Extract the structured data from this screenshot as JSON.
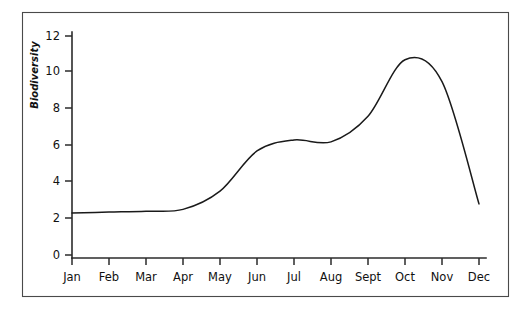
{
  "chart_data": {
    "type": "line",
    "title": "",
    "subtitle": "",
    "xlabel": "",
    "ylabel": "Biodiversity",
    "categories": [
      "Jan",
      "Feb",
      "Mar",
      "Apr",
      "May",
      "Jun",
      "Jul",
      "Aug",
      "Sept",
      "Oct",
      "Nov",
      "Dec"
    ],
    "values": [
      2.3,
      2.35,
      2.4,
      2.5,
      3.5,
      5.7,
      6.3,
      6.2,
      7.6,
      10.7,
      9.5,
      2.8
    ],
    "series": [
      {
        "name": "Biodiversity",
        "values": [
          2.3,
          2.35,
          2.4,
          2.5,
          3.5,
          5.7,
          6.3,
          6.2,
          7.6,
          10.7,
          9.5,
          2.8
        ]
      }
    ],
    "ylim": [
      0,
      12
    ],
    "yticks": [
      0,
      2,
      4,
      6,
      8,
      10,
      12
    ],
    "ytick_labels": [
      "0",
      "2",
      "4",
      "6",
      "8",
      "10",
      "12"
    ],
    "xtick_labels": [
      "Jan",
      "Feb",
      "Mar",
      "Apr",
      "May",
      "Jun",
      "Jul",
      "Aug",
      "Sept",
      "Oct",
      "Nov",
      "Dec"
    ],
    "grid": false,
    "legend": "none",
    "annotations": [],
    "peak": {
      "label": "",
      "x_between": [
        "Oct",
        "Nov"
      ],
      "value": 11.0
    },
    "line_color": "#1a1a1a",
    "axis_color": "#2b2b2b",
    "frame_color": "#4a4a4a",
    "background_color": "#ffffff"
  },
  "figure": {
    "border_visible": true
  }
}
